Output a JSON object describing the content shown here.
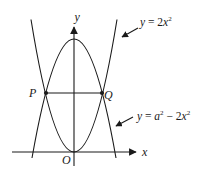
{
  "axes": {
    "x_label": "x",
    "y_label": "y",
    "origin_label": "O"
  },
  "points": {
    "P": "P",
    "Q": "Q"
  },
  "curves": {
    "upper": {
      "lhs": "y",
      "eq": " = ",
      "coef": "2",
      "var": "x",
      "exp": "2"
    },
    "lower": {
      "lhs": "y",
      "eq": " = ",
      "a": "a",
      "a_exp": "2",
      "minus": " − ",
      "coef": "2",
      "var": "x",
      "exp": "2"
    }
  },
  "colors": {
    "stroke": "#1a1a1a",
    "background": "#ffffff"
  }
}
